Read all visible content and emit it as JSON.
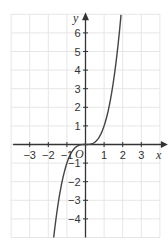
{
  "chart_data": {
    "type": "line",
    "title": "",
    "xlabel": "x",
    "ylabel": "y",
    "origin_label": "O",
    "xlim": [
      -4,
      4
    ],
    "ylim": [
      -5,
      7
    ],
    "grid": true,
    "x_ticks": [
      -3,
      -2,
      -1,
      1,
      2,
      3
    ],
    "x_tick_labels": [
      "−3",
      "−2",
      "−1",
      "1",
      "2",
      "3"
    ],
    "y_ticks": [
      -4,
      -3,
      -2,
      -1,
      1,
      2,
      3,
      4,
      5,
      6
    ],
    "y_tick_labels": [
      "−4",
      "−3",
      "−2",
      "−1",
      "1",
      "2",
      "3",
      "4",
      "5",
      "6"
    ],
    "series": [
      {
        "name": "y = x^3",
        "x": [
          -1.71,
          -1.5,
          -1.25,
          -1.0,
          -0.75,
          -0.5,
          -0.25,
          0,
          0.25,
          0.5,
          0.75,
          1.0,
          1.25,
          1.5,
          1.75,
          1.91
        ],
        "y": [
          -5.0,
          -3.375,
          -1.953,
          -1.0,
          -0.422,
          -0.125,
          -0.016,
          0,
          0.016,
          0.125,
          0.422,
          1.0,
          1.953,
          3.375,
          5.359,
          7.0
        ]
      }
    ],
    "colors": {
      "grid": "#e6e6e6",
      "axis": "#333333",
      "curve": "#444444",
      "text": "#333333"
    }
  }
}
